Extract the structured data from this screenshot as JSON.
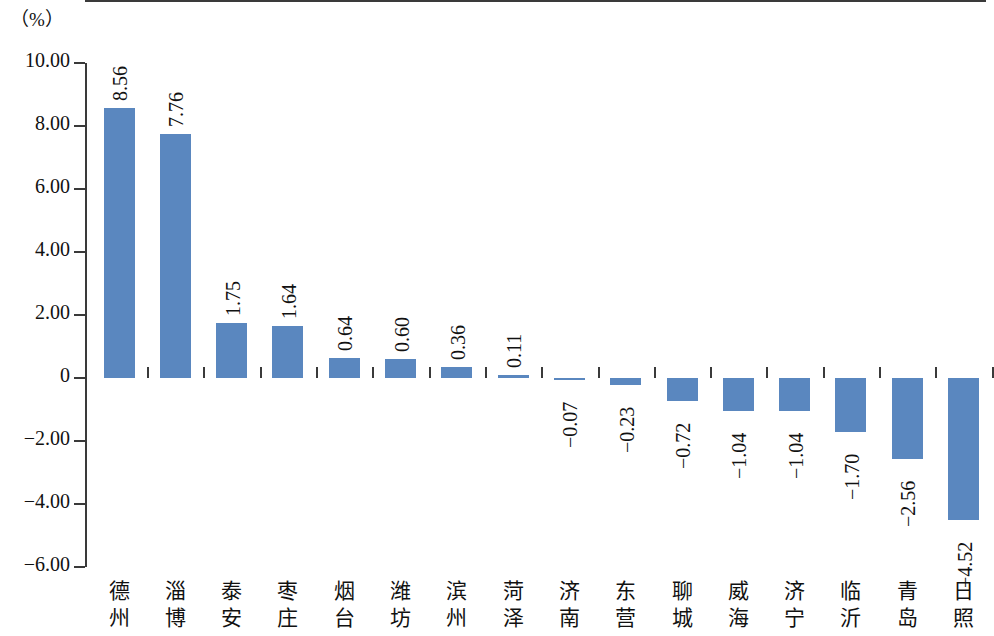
{
  "chart_data": {
    "type": "bar",
    "title": "",
    "subtitle": "",
    "xlabel": "",
    "ylabel": "（%）",
    "ylim": [
      -6.0,
      10.0
    ],
    "ytick_labels": [
      "10.00",
      "8.00",
      "6.00",
      "4.00",
      "2.00",
      "0",
      "-2.00",
      "-4.00",
      "-6.00"
    ],
    "ytick_values": [
      10,
      8,
      6,
      4,
      2,
      0,
      -2,
      -4,
      -6
    ],
    "grid": false,
    "legend": "none",
    "series_color": "#5a87bf",
    "axis_color": "#3a3a3a",
    "categories": [
      "德州",
      "淄博",
      "泰安",
      "枣庄",
      "烟台",
      "潍坊",
      "滨州",
      "菏泽",
      "济南",
      "东营",
      "聊城",
      "威海",
      "济宁",
      "临沂",
      "青岛",
      "日照"
    ],
    "values": [
      8.56,
      7.76,
      1.75,
      1.64,
      0.64,
      0.6,
      0.36,
      0.11,
      -0.07,
      -0.23,
      -0.72,
      -1.04,
      -1.04,
      -1.7,
      -2.56,
      -4.52
    ],
    "value_labels": [
      "8.56",
      "7.76",
      "1.75",
      "1.64",
      "0.64",
      "0.60",
      "0.36",
      "0.11",
      "-0.07",
      "-0.23",
      "-0.72",
      "-1.04",
      "-1.04",
      "-1.70",
      "-2.56",
      "-4.52"
    ]
  }
}
